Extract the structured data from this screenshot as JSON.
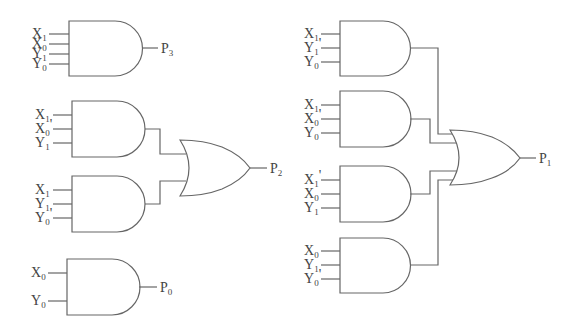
{
  "colors": {
    "line": "#666666",
    "text": "#444444",
    "background": "#ffffff"
  },
  "gates": [
    {
      "id": "and_p3",
      "type": "AND",
      "inputs": [
        {
          "base": "X",
          "sub": "1",
          "prime": ""
        },
        {
          "base": "X",
          "sub": "0",
          "prime": ""
        },
        {
          "base": "Y",
          "sub": "1",
          "prime": ""
        },
        {
          "base": "Y",
          "sub": "0",
          "prime": ""
        }
      ],
      "output": {
        "base": "P",
        "sub": "3"
      }
    },
    {
      "id": "and_p2a",
      "type": "AND",
      "inputs": [
        {
          "base": "X",
          "sub": "1",
          "prime": ""
        },
        {
          "base": "X",
          "sub": "0",
          "prime": "'"
        },
        {
          "base": "Y",
          "sub": "1",
          "prime": ""
        }
      ]
    },
    {
      "id": "and_p2b",
      "type": "AND",
      "inputs": [
        {
          "base": "X",
          "sub": "1",
          "prime": ""
        },
        {
          "base": "Y",
          "sub": "1",
          "prime": ""
        },
        {
          "base": "Y",
          "sub": "0",
          "prime": "'"
        }
      ]
    },
    {
      "id": "or_p2",
      "type": "OR",
      "output": {
        "base": "P",
        "sub": "2"
      }
    },
    {
      "id": "and_p0",
      "type": "AND",
      "inputs": [
        {
          "base": "X",
          "sub": "0",
          "prime": ""
        },
        {
          "base": "Y",
          "sub": "0",
          "prime": ""
        }
      ],
      "output": {
        "base": "P",
        "sub": "0"
      }
    },
    {
      "id": "and_p1a",
      "type": "AND",
      "inputs": [
        {
          "base": "X",
          "sub": "1",
          "prime": ""
        },
        {
          "base": "Y",
          "sub": "1",
          "prime": "'"
        },
        {
          "base": "Y",
          "sub": "0",
          "prime": ""
        }
      ]
    },
    {
      "id": "and_p1b",
      "type": "AND",
      "inputs": [
        {
          "base": "X",
          "sub": "1",
          "prime": ""
        },
        {
          "base": "X",
          "sub": "0",
          "prime": "'"
        },
        {
          "base": "Y",
          "sub": "0",
          "prime": ""
        }
      ]
    },
    {
      "id": "and_p1c",
      "type": "AND",
      "inputs": [
        {
          "base": "X",
          "sub": "1",
          "prime": "'"
        },
        {
          "base": "X",
          "sub": "0",
          "prime": ""
        },
        {
          "base": "Y",
          "sub": "1",
          "prime": ""
        }
      ]
    },
    {
      "id": "and_p1d",
      "type": "AND",
      "inputs": [
        {
          "base": "X",
          "sub": "0",
          "prime": ""
        },
        {
          "base": "Y",
          "sub": "1",
          "prime": ""
        },
        {
          "base": "Y",
          "sub": "0",
          "prime": "'"
        }
      ]
    },
    {
      "id": "or_p1",
      "type": "OR",
      "output": {
        "base": "P",
        "sub": "1"
      }
    }
  ]
}
